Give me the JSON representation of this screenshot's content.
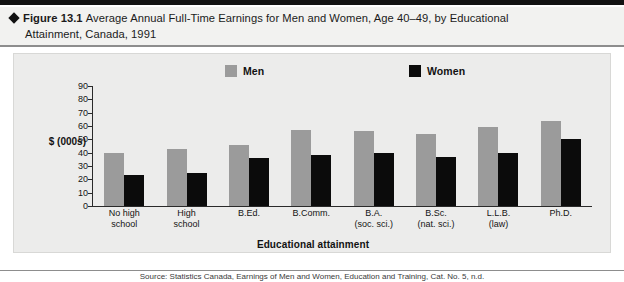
{
  "figure": {
    "marker": "diamond-bullet",
    "label": "Figure 13.1",
    "title_line1": "Average Annual Full-Time Earnings for Men and Women, Age 40–49, by Educational",
    "title_line2": "Attainment, Canada, 1991"
  },
  "colors": {
    "men_bar": "#9b9b9b",
    "women_bar": "#0b0b0b",
    "panel_background": "#ececeb",
    "title_background": "#f2f2f0",
    "axis": "#2a2a2a",
    "rule": "#8d8d8d",
    "top_bar": "#121212"
  },
  "caption": {
    "text": "Source: Statistics Canada, Earnings of Men and Women, Education and Training, Cat. No. 5, n.d."
  },
  "chart_data": {
    "type": "bar",
    "title": "Average Annual Full-Time Earnings for Men and Women, Age 40–49, by Educational Attainment, Canada, 1991",
    "xlabel": "Educational attainment",
    "ylabel": "$ (000s)",
    "ylim": [
      0,
      90
    ],
    "yticks": [
      0,
      10,
      20,
      30,
      40,
      50,
      60,
      70,
      80,
      90
    ],
    "ytick_labels": [
      "0",
      "10",
      "20",
      "30",
      "40",
      "50",
      "60",
      "70",
      "80",
      "90"
    ],
    "grid": false,
    "legend_position": "top-center",
    "categories": [
      "No high school",
      "High school",
      "B.Ed.",
      "B.Comm.",
      "B.A. (soc. sci.)",
      "B.Sc. (nat. sci.)",
      "L.L.B. (law)",
      "Ph.D."
    ],
    "category_lines": [
      [
        "No high",
        "school"
      ],
      [
        "High",
        "school"
      ],
      [
        "B.Ed.",
        ""
      ],
      [
        "B.Comm.",
        ""
      ],
      [
        "B.A.",
        "(soc. sci.)"
      ],
      [
        "B.Sc.",
        "(nat. sci.)"
      ],
      [
        "L.L.B.",
        "(law)"
      ],
      [
        "Ph.D.",
        ""
      ]
    ],
    "series": [
      {
        "name": "Men",
        "color": "#9b9b9b",
        "values": [
          40,
          43,
          46,
          57,
          56,
          54,
          59,
          64
        ]
      },
      {
        "name": "Women",
        "color": "#0b0b0b",
        "values": [
          23,
          25,
          36,
          38,
          40,
          37,
          40,
          50
        ]
      }
    ]
  }
}
